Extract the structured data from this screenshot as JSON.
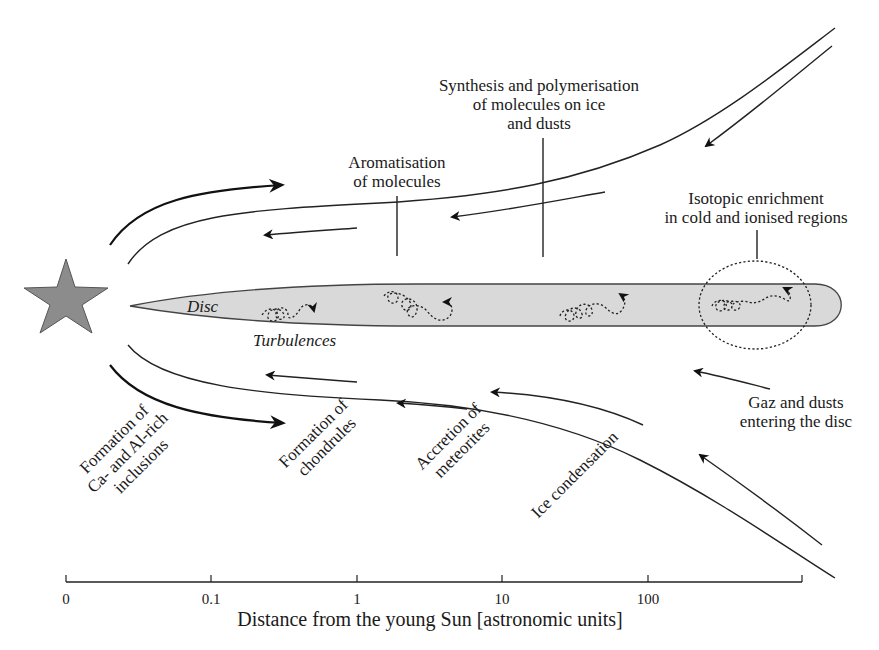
{
  "diagram": {
    "star": {
      "label": "young Sun",
      "color": "#8c8c8c"
    },
    "disc": {
      "label": "Disc",
      "color": "#d9d9d9"
    },
    "turbulences_label": "Turbulences",
    "labels": {
      "synthesis": [
        "Synthesis and polymerisation",
        "of molecules on ice",
        "and dusts"
      ],
      "aromatisation": [
        "Aromatisation",
        "of molecules"
      ],
      "isotopic": [
        "Isotopic enrichment",
        "in cold and ionised regions"
      ],
      "gaz": [
        "Gaz and dusts",
        "entering the disc"
      ],
      "cai": [
        "Formation of",
        "Ca- and Al-rich",
        "inclusions"
      ],
      "chondrules": [
        "Formation of",
        "chondrules"
      ],
      "meteorites": [
        "Accretion of",
        "meteorites"
      ],
      "ice": [
        "Ice condensation"
      ]
    },
    "axis": {
      "ticks": [
        "0",
        "0.1",
        "1",
        "10",
        "100"
      ],
      "title": "Distance from the young Sun [astronomic units]"
    }
  }
}
